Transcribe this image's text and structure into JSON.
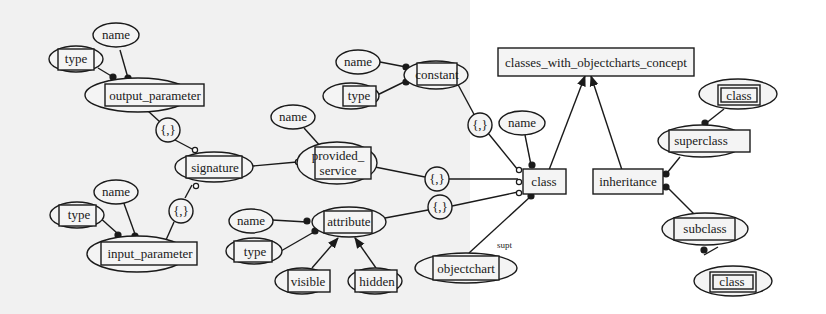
{
  "diagram": {
    "type": "concept feature diagram",
    "colors": {
      "stroke": "#1a1a1a",
      "fill": "#f4f4f4",
      "background_left": "#f1f1f1",
      "background_right": "#ffffff"
    },
    "nodes": {
      "root": {
        "label": "classes_with_objectcharts_concept",
        "shape": "rectangle"
      },
      "class": {
        "label": "class",
        "shape": "rectangle"
      },
      "inheritance": {
        "label": "inheritance",
        "shape": "rectangle"
      },
      "class_name": {
        "label": "name",
        "shape": "ellipse"
      },
      "group_constant": {
        "label": "{,}",
        "shape": "circle"
      },
      "constant": {
        "label": "constant",
        "shape": "ellipse-box"
      },
      "constant_name": {
        "label": "name",
        "shape": "ellipse"
      },
      "constant_type": {
        "label": "type",
        "shape": "ellipse-box"
      },
      "group_service": {
        "label": "{,}",
        "shape": "circle"
      },
      "provided_service": {
        "label_line1": "provided_",
        "label_line2": "service",
        "shape": "ellipse-box"
      },
      "service_name": {
        "label": "name",
        "shape": "ellipse"
      },
      "signature": {
        "label": "signature",
        "shape": "ellipse-box"
      },
      "group_output": {
        "label": "{,}",
        "shape": "circle"
      },
      "output_parameter": {
        "label": "output_parameter",
        "shape": "ellipse-box"
      },
      "output_name": {
        "label": "name",
        "shape": "ellipse"
      },
      "output_type": {
        "label": "type",
        "shape": "ellipse-box"
      },
      "group_input": {
        "label": "{,}",
        "shape": "circle"
      },
      "input_parameter": {
        "label": "input_parameter",
        "shape": "ellipse-box"
      },
      "input_name": {
        "label": "name",
        "shape": "ellipse"
      },
      "input_type": {
        "label": "type",
        "shape": "ellipse-box"
      },
      "group_attribute": {
        "label": "{,}",
        "shape": "circle"
      },
      "attribute": {
        "label": "attribute",
        "shape": "ellipse-box"
      },
      "attribute_name": {
        "label": "name",
        "shape": "ellipse"
      },
      "attribute_type": {
        "label": "type",
        "shape": "ellipse-box"
      },
      "visible": {
        "label": "visible",
        "shape": "ellipse-box"
      },
      "hidden": {
        "label": "hidden",
        "shape": "ellipse-box"
      },
      "objectchart": {
        "label": "objectchart",
        "shape": "ellipse-box"
      },
      "superclass": {
        "label": "superclass",
        "shape": "ellipse-box"
      },
      "super_class_ref": {
        "label": "class",
        "shape": "ellipse-double-box"
      },
      "subclass": {
        "label": "subclass",
        "shape": "ellipse-box"
      },
      "sub_class_ref": {
        "label": "class",
        "shape": "ellipse-double-box"
      }
    },
    "edge_labels": {
      "objectchart_to_class": "supt"
    }
  }
}
